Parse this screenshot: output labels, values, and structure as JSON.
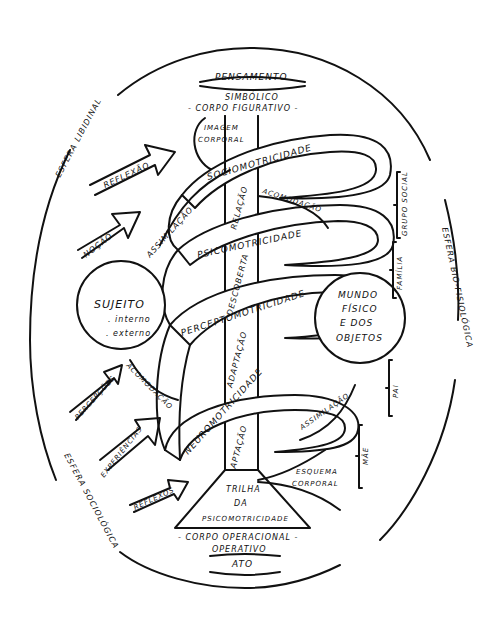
{
  "diagram": {
    "spheres": {
      "libidinal": "ESFERA LIBIDINAL",
      "bio_fisiologica": "ESFERA BIO-FISIOLÓGICA",
      "sociologica": "ESFERA SOCIOLÓGICA"
    },
    "top": {
      "pensamento": "PENSAMENTO",
      "simbolico": "SIMBÓLICO",
      "corpo_figurativo": "- CORPO FIGURATIVO -"
    },
    "bottom": {
      "corpo_operacional": "- CORPO OPERACIONAL -",
      "operativo": "OPERATIVO",
      "ato": "ATO"
    },
    "trail": {
      "line1": "TRILHA",
      "line2": "DA",
      "line3": "PSICOMOTRICIDADE"
    },
    "spiral_levels": [
      "SOCIOMOTRICIDADE",
      "PSICOMOTRICIDADE",
      "PERCEPTOMOTRICIDADE",
      "NEUROMOTRICIDADE"
    ],
    "trunk_labels": [
      "RELAÇÃO",
      "DESCOBERTA",
      "ADAPTAÇÃO",
      "ADAPTAÇÃO"
    ],
    "imagem_corporal": {
      "line1": "IMAGEM",
      "line2": "CORPORAL"
    },
    "esquema_corporal": {
      "line1": "ESQUEMA",
      "line2": "CORPORAL"
    },
    "process_labels": {
      "assimilacao_top": "ASSIMILAÇÃO",
      "acomodacao_top": "ACOMODAÇÃO",
      "acomodacao_bottom": "ACOMODAÇÃO",
      "assimilacao_bottom": "ASSIMILAÇÃO"
    },
    "arrows_left": [
      "REFLEXÃO",
      "NOÇÃO",
      "PERCEPÇÕES",
      "EXPERIÊNCIAS",
      "REFLEXOS"
    ],
    "sujeito": {
      "title": "SUJEITO",
      "item1": ". interno",
      "item2": ". externo"
    },
    "mundo": {
      "line1": "MUNDO",
      "line2": "FÍSICO",
      "line3": "E DOS",
      "line4": "OBJETOS"
    },
    "brackets_right": [
      "GRUPO SOCIAL",
      "FAMÍLIA",
      "PAI",
      "MÃE"
    ],
    "colors": {
      "ink": "#111111",
      "paper": "#ffffff"
    }
  }
}
